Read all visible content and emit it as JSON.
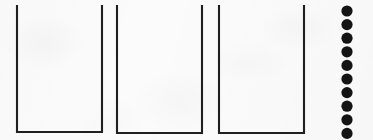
{
  "figure": {
    "background_color": "#fbfbfb",
    "ink_color": "#201f1f",
    "counter_color": "#141414",
    "canvas": {
      "width": 373,
      "height": 140
    }
  },
  "containers": {
    "count": 3,
    "shape": "open-top-u",
    "stroke_width": 2.1,
    "items": [
      {
        "label": "container-1",
        "left_x": 17,
        "right_x": 102,
        "top_y": 5,
        "bottom_y": 132
      },
      {
        "label": "container-2",
        "left_x": 117,
        "right_x": 202,
        "top_y": 5,
        "bottom_y": 133
      },
      {
        "label": "container-3",
        "left_x": 219,
        "right_x": 304,
        "top_y": 5,
        "bottom_y": 133
      }
    ]
  },
  "counters": {
    "count": 10,
    "shape": "filled-circle",
    "radius": 5.6,
    "center_x": 347,
    "first_center_y": 11,
    "pitch_y": 13.6,
    "items": [
      {
        "label": "counter-1",
        "cy": 11
      },
      {
        "label": "counter-2",
        "cy": 24.6
      },
      {
        "label": "counter-3",
        "cy": 38.2
      },
      {
        "label": "counter-4",
        "cy": 51.8
      },
      {
        "label": "counter-5",
        "cy": 65.4
      },
      {
        "label": "counter-6",
        "cy": 79
      },
      {
        "label": "counter-7",
        "cy": 92.6
      },
      {
        "label": "counter-8",
        "cy": 106.2
      },
      {
        "label": "counter-9",
        "cy": 119.8
      },
      {
        "label": "counter-10",
        "cy": 133.4
      }
    ]
  }
}
